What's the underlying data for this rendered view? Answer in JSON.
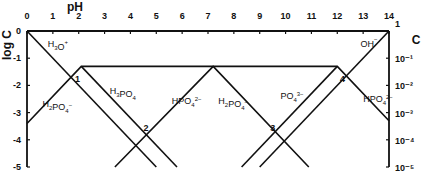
{
  "chart_data": {
    "type": "line",
    "title": "",
    "xlabel": "pH",
    "ylabel": "log C",
    "ylabel_right": "C",
    "xlim": [
      0,
      14
    ],
    "ylim": [
      -5,
      0
    ],
    "grid": false,
    "x_ticks": [
      "0",
      "1",
      "2",
      "3",
      "4",
      "5",
      "6",
      "7",
      "8",
      "9",
      "10",
      "11",
      "12",
      "13",
      "14"
    ],
    "y_ticks_left": [
      "0",
      "-1",
      "-2",
      "-3",
      "-4",
      "-5"
    ],
    "y_ticks_right": [
      "1",
      "10⁻¹",
      "10⁻²",
      "10⁻³",
      "10⁻⁴",
      "10⁻⁵"
    ],
    "series": [
      {
        "name": "H3O+",
        "points": [
          [
            0,
            0
          ],
          [
            5,
            -5
          ]
        ]
      },
      {
        "name": "OH-",
        "points": [
          [
            9,
            -5
          ],
          [
            14,
            0
          ]
        ]
      },
      {
        "name": "H3PO4",
        "points": [
          [
            2.1,
            -1.3
          ],
          [
            5.8,
            -5
          ]
        ]
      },
      {
        "name": "H2PO4-",
        "points": [
          [
            0,
            -3.4
          ],
          [
            2.1,
            -1.3
          ],
          [
            7.2,
            -1.3
          ],
          [
            10.9,
            -5
          ]
        ]
      },
      {
        "name": "HPO4 2-",
        "points": [
          [
            3.4,
            -5
          ],
          [
            7.2,
            -1.3
          ],
          [
            12.0,
            -1.3
          ],
          [
            14,
            -3.3
          ]
        ]
      },
      {
        "name": "PO4 3-",
        "points": [
          [
            8.3,
            -5
          ],
          [
            12.0,
            -1.3
          ]
        ]
      }
    ],
    "annotations": [
      {
        "label": "1",
        "x": 1.95,
        "y": -1.9
      },
      {
        "label": "2",
        "x": 4.6,
        "y": -3.7
      },
      {
        "label": "3",
        "x": 9.5,
        "y": -3.7
      },
      {
        "label": "4",
        "x": 12.2,
        "y": -1.9
      }
    ],
    "species_labels": [
      {
        "text": "H3O+",
        "x": 0.8,
        "y": -0.6
      },
      {
        "text": "H2PO4-",
        "x": 0.6,
        "y": -2.8
      },
      {
        "text": "H3PO4",
        "x": 3.2,
        "y": -2.3
      },
      {
        "text": "HPO4 2-",
        "x": 5.6,
        "y": -2.7
      },
      {
        "text": "H2PO4-",
        "x": 7.4,
        "y": -2.7
      },
      {
        "text": "PO4 3-",
        "x": 9.8,
        "y": -2.5
      },
      {
        "text": "OH-",
        "x": 12.9,
        "y": -0.6
      },
      {
        "text": "HPO4 2-",
        "x": 13.0,
        "y": -2.6
      }
    ]
  }
}
